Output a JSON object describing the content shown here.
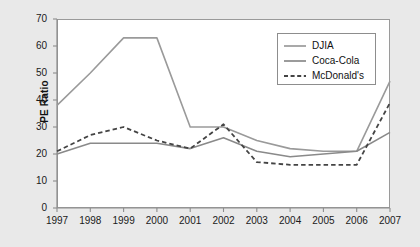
{
  "chart_data": {
    "type": "line",
    "title": "",
    "xlabel": "",
    "ylabel": "PE Ratio",
    "categories": [
      1997,
      1998,
      1999,
      2000,
      2001,
      2002,
      2003,
      2004,
      2005,
      2006,
      2007
    ],
    "xlim": [
      1997,
      2007
    ],
    "ylim": [
      0,
      70
    ],
    "yticks": [
      0,
      10,
      20,
      30,
      40,
      50,
      60,
      70
    ],
    "xticks": [
      "1997",
      "1998",
      "1999",
      "2000",
      "2001",
      "2002",
      "2003",
      "2004",
      "2005",
      "2006",
      "2007"
    ],
    "grid": false,
    "legend_position": "top-right",
    "series": [
      {
        "name": "DJIA",
        "style": "solid",
        "color": "#9a9a9a",
        "values": [
          38,
          50,
          63,
          63,
          30,
          30,
          25,
          22,
          21,
          21,
          47
        ]
      },
      {
        "name": "Coca-Cola",
        "style": "solid",
        "color": "#8a8a8a",
        "values": [
          20,
          24,
          24,
          24,
          22,
          26,
          21,
          19,
          20,
          21,
          28
        ]
      },
      {
        "name": "McDonald's",
        "style": "dashed",
        "color": "#444444",
        "values": [
          21,
          27,
          30,
          25,
          22,
          31,
          17,
          16,
          16,
          16,
          39
        ]
      }
    ]
  },
  "axis": {
    "y_title": "PE Ratio",
    "y_labels": [
      "70",
      "60",
      "50",
      "40",
      "30",
      "20",
      "10",
      "0"
    ],
    "x_labels": [
      "1997",
      "1998",
      "1999",
      "2000",
      "2001",
      "2002",
      "2003",
      "2004",
      "2005",
      "2006",
      "2007"
    ]
  },
  "legend": {
    "entries": [
      {
        "label": "DJIA",
        "style": "solid",
        "color": "#9a9a9a"
      },
      {
        "label": "Coca-Cola",
        "style": "solid",
        "color": "#8a8a8a"
      },
      {
        "label": "McDonald's",
        "style": "dashed",
        "color": "#444444"
      }
    ]
  }
}
